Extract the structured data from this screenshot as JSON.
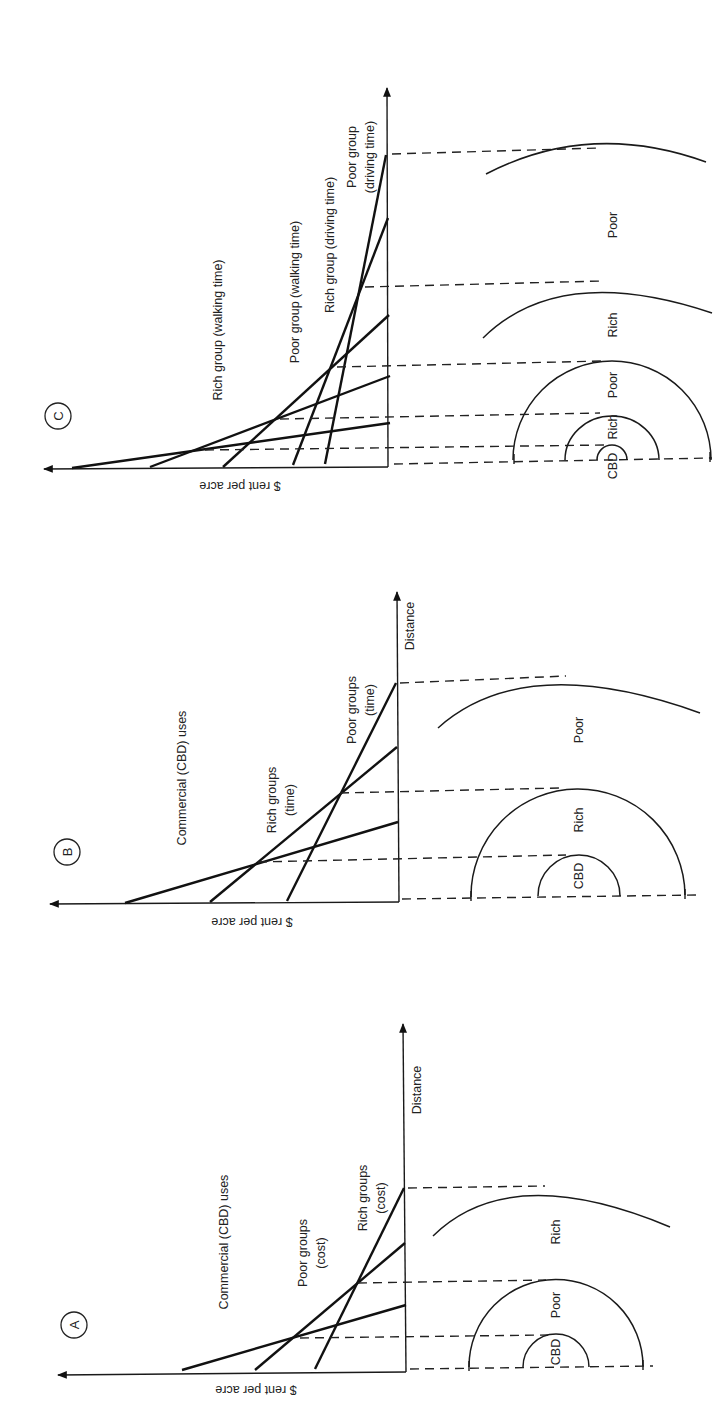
{
  "figure": {
    "orientation": "rotated 90 degrees clockwise",
    "panels": [
      {
        "id": "C",
        "panel_label": "C",
        "y_axis_label": "$ rent per acre",
        "x_axis_label": "",
        "bid_rent_curves": [
          {
            "label": "Rich group (walking time)"
          },
          {
            "label": "Poor group (walking time)"
          },
          {
            "label": "Rich group (driving time)"
          },
          {
            "label_line1": "Poor group",
            "label_line2": "(driving time)"
          }
        ],
        "zones": [
          "CBD",
          "Rich",
          "Poor",
          "Rich",
          "Poor"
        ]
      },
      {
        "id": "B",
        "panel_label": "B",
        "y_axis_label": "$ rent per acre",
        "x_axis_label": "Distance",
        "bid_rent_curves": [
          {
            "label": "Commercial (CBD) uses"
          },
          {
            "label_line1": "Rich groups",
            "label_line2": "(time)"
          },
          {
            "label_line1": "Poor groups",
            "label_line2": "(time)"
          }
        ],
        "zones": [
          "CBD",
          "Rich",
          "Poor"
        ]
      },
      {
        "id": "A",
        "panel_label": "A",
        "y_axis_label": "$ rent per acre",
        "x_axis_label": "Distance",
        "bid_rent_curves": [
          {
            "label": "Commercial (CBD) uses"
          },
          {
            "label_line1": "Poor groups",
            "label_line2": "(cost)"
          },
          {
            "label_line1": "Rich groups",
            "label_line2": "(cost)"
          }
        ],
        "zones": [
          "CBD",
          "Poor",
          "Rich"
        ]
      }
    ]
  }
}
